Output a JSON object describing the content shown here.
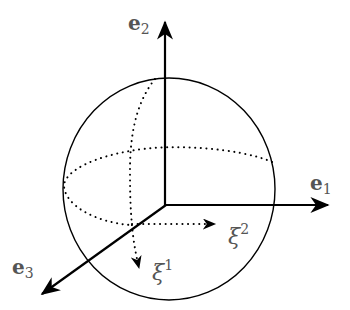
{
  "diagram": {
    "type": "coordinate-sphere",
    "colors": {
      "stroke": "#000000",
      "label": "#555555",
      "background": "#ffffff"
    },
    "axes": [
      {
        "id": "e1",
        "base": "e",
        "sub": "1",
        "direction": "right"
      },
      {
        "id": "e2",
        "base": "e",
        "sub": "2",
        "direction": "up"
      },
      {
        "id": "e3",
        "base": "e",
        "sub": "3",
        "direction": "down-left"
      }
    ],
    "coordinates": [
      {
        "id": "xi1",
        "base": "ξ",
        "sup": "1",
        "style": "dotted-arrow",
        "direction": "down along meridian"
      },
      {
        "id": "xi2",
        "base": "ξ",
        "sup": "2",
        "style": "dotted-arrow",
        "direction": "right along equator"
      }
    ],
    "sphere": {
      "outline": "solid",
      "equator": "dotted",
      "meridian": "dotted"
    }
  }
}
